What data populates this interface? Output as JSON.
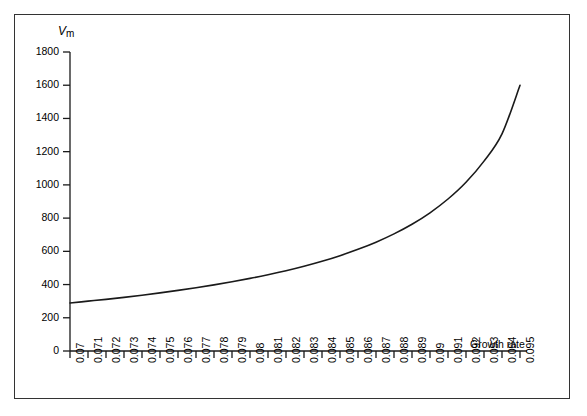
{
  "figure": {
    "background_color": "#ffffff",
    "frame_color": "#333333",
    "line_color": "#1a1a1a"
  },
  "chart_data": {
    "type": "line",
    "title": "",
    "subtitle": "",
    "xlabel": "Growth rate",
    "ylabel": "V",
    "ylabel_sub": "m",
    "ylim": [
      0,
      1800
    ],
    "xlim": [
      0.07,
      0.095
    ],
    "grid": false,
    "legend": null,
    "y_ticks": [
      0,
      200,
      400,
      600,
      800,
      1000,
      1200,
      1400,
      1600,
      1800
    ],
    "y_tick_labels": [
      "0",
      "200",
      "400",
      "600",
      "800",
      "1000",
      "1200",
      "1400",
      "1600",
      "1800"
    ],
    "x_ticks": [
      0.07,
      0.071,
      0.072,
      0.073,
      0.074,
      0.075,
      0.076,
      0.077,
      0.078,
      0.079,
      0.08,
      0.081,
      0.082,
      0.083,
      0.084,
      0.085,
      0.086,
      0.087,
      0.088,
      0.089,
      0.09,
      0.091,
      0.092,
      0.093,
      0.094,
      0.095
    ],
    "x_tick_labels": [
      "0.07",
      "0.071",
      "0.072",
      "0.073",
      "0.074",
      "0.075",
      "0.076",
      "0.077",
      "0.078",
      "0.079",
      "0.08",
      "0.081",
      "0.082",
      "0.083",
      "0.084",
      "0.085",
      "0.086",
      "0.087",
      "0.088",
      "0.089",
      "0.09",
      "0.091",
      "0.092",
      "0.093",
      "0.094",
      "0.095"
    ],
    "series": [
      {
        "name": "Vm",
        "x": [
          0.07,
          0.071,
          0.072,
          0.073,
          0.074,
          0.075,
          0.076,
          0.077,
          0.078,
          0.079,
          0.08,
          0.081,
          0.082,
          0.083,
          0.084,
          0.085,
          0.086,
          0.087,
          0.088,
          0.089,
          0.09,
          0.091,
          0.092,
          0.093,
          0.094,
          0.095
        ],
        "values": [
          289,
          300,
          311,
          323,
          336,
          350,
          365,
          381,
          398,
          417,
          437,
          459,
          483,
          510,
          540,
          574,
          612,
          655,
          705,
          763,
          832,
          915,
          1016,
          1143,
          1307,
          1600
        ]
      }
    ]
  },
  "axes_geometry": {
    "x0_px": 70,
    "x1_px": 520,
    "y0_px": 351,
    "y1_px": 52,
    "tick_spacing_px": 18,
    "y_tick_spacing_px": 33.2
  }
}
